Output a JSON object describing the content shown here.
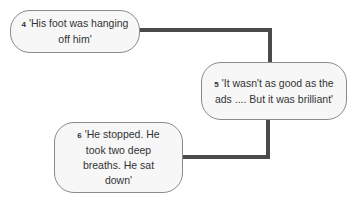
{
  "diagram": {
    "nodes": [
      {
        "number": "4",
        "text": "'His foot was hanging off him'"
      },
      {
        "number": "5",
        "text": "'It wasn't as good as the ads .... But it was brilliant'"
      },
      {
        "number": "6",
        "text": "'He stopped. He took two deep breaths. He sat down'"
      }
    ],
    "connector_color": "#4a4a4a",
    "box_fill": "#f7f7f7",
    "box_border": "#8a8a8a"
  }
}
